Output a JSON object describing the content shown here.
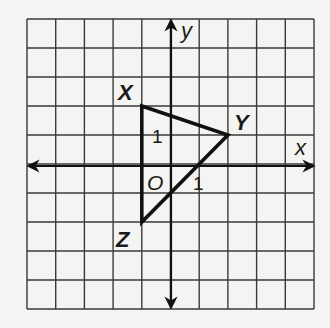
{
  "diagram": {
    "type": "coordinate-plane-triangle",
    "grid": {
      "cells_x": 10,
      "cells_y": 10,
      "x_range": [
        -5,
        5
      ],
      "y_range": [
        -5,
        5
      ],
      "line_color": "#3a3a3a"
    },
    "axes": {
      "x_label": "x",
      "y_label": "y",
      "origin_label": "O",
      "color": "#111111"
    },
    "triangle": {
      "stroke_color": "#111111",
      "vertices": [
        {
          "name": "X",
          "label": "X",
          "x": -1,
          "y": 2
        },
        {
          "name": "Y",
          "label": "Y",
          "x": 2,
          "y": 1
        },
        {
          "name": "Z",
          "label": "Z",
          "x": -1,
          "y": -2
        }
      ]
    },
    "scale_labels": [
      {
        "text": "1",
        "position": "on y-axis segment above origin, inside triangle"
      },
      {
        "text": "1",
        "position": "on x-axis segment right of origin, below axis"
      }
    ]
  }
}
